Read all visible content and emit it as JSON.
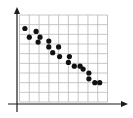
{
  "chart_data": {
    "type": "scatter",
    "title": "",
    "xlabel": "",
    "ylabel": "",
    "grid": true,
    "legend": null,
    "xlim": [
      0,
      9
    ],
    "ylim": [
      0,
      9
    ],
    "grid_cols": 9,
    "grid_rows": 9,
    "points": [
      {
        "x": 0.55,
        "y": 7.6
      },
      {
        "x": 1.0,
        "y": 6.7
      },
      {
        "x": 1.7,
        "y": 7.3
      },
      {
        "x": 2.1,
        "y": 6.7
      },
      {
        "x": 1.9,
        "y": 6.2
      },
      {
        "x": 3.0,
        "y": 6.3
      },
      {
        "x": 3.0,
        "y": 5.7
      },
      {
        "x": 3.4,
        "y": 5.1
      },
      {
        "x": 4.0,
        "y": 5.7
      },
      {
        "x": 4.1,
        "y": 4.7
      },
      {
        "x": 5.1,
        "y": 4.7
      },
      {
        "x": 5.0,
        "y": 4.1
      },
      {
        "x": 5.6,
        "y": 3.7
      },
      {
        "x": 6.2,
        "y": 3.7
      },
      {
        "x": 6.5,
        "y": 3.4
      },
      {
        "x": 7.1,
        "y": 3.0
      },
      {
        "x": 7.1,
        "y": 2.4
      },
      {
        "x": 7.7,
        "y": 2.0
      },
      {
        "x": 8.2,
        "y": 2.0
      }
    ],
    "trend": "negative correlation"
  },
  "colors": {
    "axis": "#1a1a1a",
    "grid": "#b8b8b8",
    "point": "#111111",
    "background": "#ffffff"
  }
}
